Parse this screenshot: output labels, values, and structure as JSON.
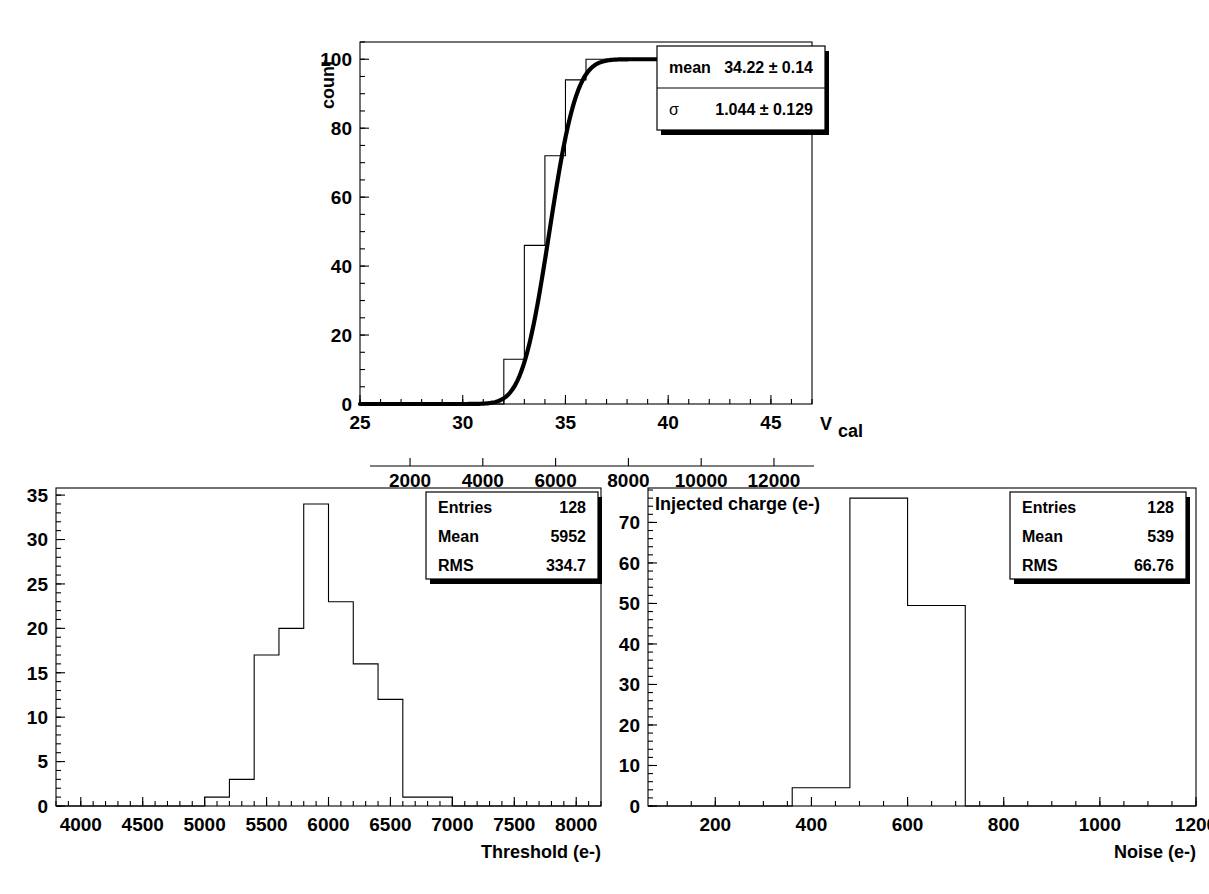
{
  "chart_data": [
    {
      "id": "scurve",
      "type": "line",
      "title": "",
      "xlabel": "V_cal",
      "xlabel_text": "V",
      "xlabel_sub": "cal",
      "ylabel": "count",
      "xlim": [
        25,
        47
      ],
      "ylim": [
        0,
        105
      ],
      "xticks": [
        25,
        30,
        35,
        40,
        45
      ],
      "xticklabels": [
        "25",
        "30",
        "35",
        "40",
        "45"
      ],
      "yticks": [
        0,
        20,
        40,
        60,
        80,
        100
      ],
      "yticklabels": [
        "0",
        "20",
        "40",
        "60",
        "80",
        "100"
      ],
      "minor_x_per_major": 5,
      "minor_y_per_major": 4,
      "grid": false,
      "secondary_axis": {
        "label": "Injected charge (e-)",
        "ticks": [
          2000,
          4000,
          6000,
          8000,
          10000,
          12000
        ],
        "ticklabels": [
          "2000",
          "4000",
          "6000",
          "8000",
          "10000",
          "12000"
        ],
        "lim": [
          900,
          13100
        ]
      },
      "histogram": {
        "bin_edges": [
          25,
          31,
          32,
          33,
          34,
          35,
          36,
          37,
          47
        ],
        "values": [
          0,
          0,
          13,
          46,
          72,
          94,
          100,
          100
        ]
      },
      "fit": {
        "function": "erf-scurve",
        "amplitude": 100,
        "mean": 34.22,
        "sigma": 1.044
      },
      "stats_box": {
        "rows": [
          {
            "label": "mean",
            "value": "34.22 ± 0.14"
          },
          {
            "label": "σ",
            "value": "1.044 ± 0.129"
          }
        ]
      }
    },
    {
      "id": "threshold",
      "type": "bar",
      "title": "",
      "xlabel": "Threshold (e-)",
      "ylabel": "",
      "xlim": [
        3800,
        8200
      ],
      "ylim": [
        0,
        35.8
      ],
      "xticks": [
        4000,
        4500,
        5000,
        5500,
        6000,
        6500,
        7000,
        7500,
        8000
      ],
      "xticklabels": [
        "4000",
        "4500",
        "5000",
        "5500",
        "6000",
        "6500",
        "7000",
        "7500",
        "8000"
      ],
      "yticks": [
        0,
        5,
        10,
        15,
        20,
        25,
        30,
        35
      ],
      "yticklabels": [
        "0",
        "5",
        "10",
        "15",
        "20",
        "25",
        "30",
        "35"
      ],
      "minor_x_per_major": 5,
      "minor_y_per_major": 5,
      "grid": false,
      "histogram": {
        "bin_edges": [
          3800,
          5000,
          5200,
          5400,
          5600,
          5800,
          6000,
          6200,
          6400,
          6600,
          7000,
          8200
        ],
        "values": [
          0,
          1,
          3,
          17,
          20,
          34,
          23,
          16,
          12,
          1,
          0
        ]
      },
      "stats_box": {
        "rows": [
          {
            "label": "Entries",
            "value": "128"
          },
          {
            "label": "Mean",
            "value": "5952"
          },
          {
            "label": "RMS",
            "value": "334.7"
          }
        ]
      }
    },
    {
      "id": "noise",
      "type": "bar",
      "title": "",
      "xlabel": "Noise (e-)",
      "ylabel": "",
      "xlim": [
        60,
        1200
      ],
      "ylim": [
        0,
        78.5
      ],
      "xticks": [
        200,
        400,
        600,
        800,
        1000,
        1200
      ],
      "xticklabels": [
        "200",
        "400",
        "600",
        "800",
        "1000",
        "1200"
      ],
      "yticks": [
        0,
        10,
        20,
        30,
        40,
        50,
        60,
        70
      ],
      "yticklabels": [
        "0",
        "10",
        "20",
        "30",
        "40",
        "50",
        "60",
        "70"
      ],
      "minor_x_per_major": 4,
      "minor_y_per_major": 5,
      "grid": false,
      "histogram": {
        "bin_edges": [
          60,
          360,
          480,
          600,
          720,
          1200
        ],
        "values": [
          0,
          4.5,
          76,
          49.5,
          0
        ]
      },
      "stats_box": {
        "rows": [
          {
            "label": "Entries",
            "value": "128"
          },
          {
            "label": "Mean",
            "value": "539"
          },
          {
            "label": "RMS",
            "value": "66.76"
          }
        ]
      }
    }
  ]
}
